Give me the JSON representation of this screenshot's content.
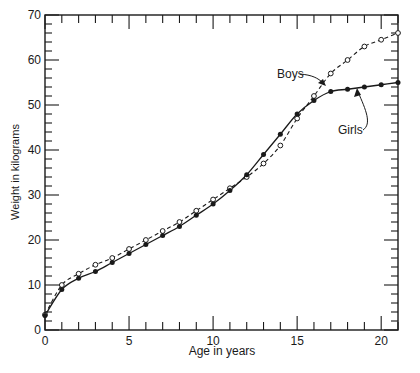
{
  "chart_data": {
    "type": "line",
    "title": "",
    "xlabel": "Age in years",
    "ylabel": "Weight in kilograms",
    "xlim": [
      0,
      21
    ],
    "ylim": [
      0,
      70
    ],
    "x_ticks": [
      0,
      5,
      10,
      15,
      20
    ],
    "y_ticks": [
      0,
      10,
      20,
      30,
      40,
      50,
      60,
      70
    ],
    "grid": false,
    "legend": "inline annotations with arrows",
    "x": [
      0,
      1,
      2,
      3,
      4,
      5,
      6,
      7,
      8,
      9,
      10,
      11,
      12,
      13,
      14,
      15,
      16,
      17,
      18,
      19,
      20,
      21
    ],
    "series": [
      {
        "name": "Boys",
        "style": "dashed line, open circle markers",
        "values": [
          3.4,
          10,
          12.5,
          14.5,
          16,
          18,
          20,
          22,
          24,
          26.5,
          29,
          31.5,
          34,
          37,
          41,
          47,
          52,
          57,
          60,
          63,
          64.5,
          66
        ]
      },
      {
        "name": "Girls",
        "style": "solid line, filled circle markers",
        "values": [
          3.2,
          9,
          11.5,
          13,
          15,
          17,
          19,
          21,
          23,
          25.5,
          28,
          31,
          34.5,
          39,
          43.5,
          48,
          51,
          53,
          53.5,
          54,
          54.5,
          55
        ]
      }
    ],
    "annotations": [
      {
        "text": "Boys",
        "points_to": "Boys curve near age 16.5"
      },
      {
        "text": "Girls",
        "points_to": "Girls curve near age 17.5"
      }
    ]
  },
  "labels": {
    "xlabel": "Age in years",
    "ylabel": "Weight in kilograms",
    "boys": "Boys",
    "girls": "Girls"
  }
}
